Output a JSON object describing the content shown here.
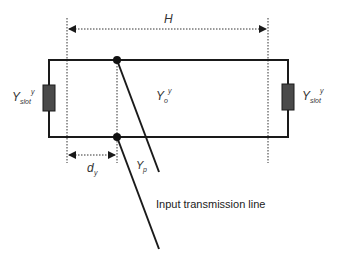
{
  "diagram": {
    "labels": {
      "width_dim": "H",
      "offset_dim": "d",
      "offset_dim_sub": "y",
      "slot_left": "Y",
      "slot_left_sub": "slot",
      "slot_left_sup": "y",
      "slot_right": "Y",
      "slot_right_sub": "slot",
      "slot_right_sup": "y",
      "line_admittance": "Y",
      "line_admittance_sub": "o",
      "line_admittance_sup": "y",
      "probe_admittance": "Y",
      "probe_admittance_sub": "p",
      "input_line": "Input transmission line"
    },
    "colors": {
      "line": "#1a1a1a",
      "slot_fill": "#4a4a4a",
      "dotted": "#333333"
    }
  }
}
